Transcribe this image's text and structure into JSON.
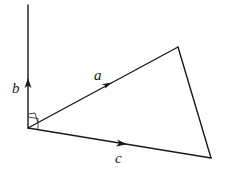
{
  "diagram": {
    "type": "vector-geometry",
    "labels": {
      "b": "b",
      "a": "a",
      "c": "c"
    },
    "vectors": [
      {
        "name": "b",
        "from": [
          28,
          128
        ],
        "to": [
          28,
          5
        ],
        "direction": "up"
      },
      {
        "name": "a",
        "from": [
          28,
          128
        ],
        "to": [
          178,
          47
        ],
        "direction": "up-right"
      },
      {
        "name": "c",
        "from": [
          28,
          128
        ],
        "to": [
          211,
          158
        ],
        "direction": "right"
      }
    ],
    "segments": [
      {
        "from": [
          178,
          47
        ],
        "to": [
          211,
          158
        ]
      }
    ],
    "markers": [
      "right-angle between b and c",
      "angle marker between b and a"
    ],
    "colors": {
      "line": "#1a1a1a",
      "background": "#ffffff"
    }
  }
}
